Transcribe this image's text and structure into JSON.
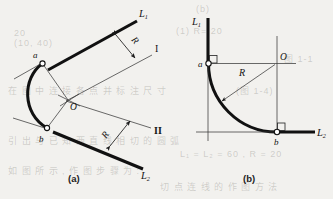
{
  "figure": {
    "background_color": "#f2f1ee",
    "ink_color": "#111111",
    "panels": [
      {
        "id": "a",
        "caption": "(a)",
        "description": "Two oblique lines L1 and L2 meeting at an obtuse V; auxiliary parallel lines I and II offset by radius R; center O located at their intersection; tangent points a and b.",
        "labels": {
          "line1": "L",
          "line1_sub": "1",
          "line2": "L",
          "line2_sub": "2",
          "radius_upper": "R",
          "radius_lower": "R",
          "aux_line_upper": "I",
          "aux_line_lower": "II",
          "center": "O",
          "tangent_point_upper": "a",
          "tangent_point_lower": "b"
        }
      },
      {
        "id": "b",
        "caption": "(b)",
        "description": "Vertical line L1 and horizontal line L2 meeting at a right angle; quarter-circle fillet of radius R; center O at intersection of offset construction lines; tangent points a and b with right-angle marks.",
        "labels": {
          "line1": "L",
          "line1_sub": "1",
          "line2": "L",
          "line2_sub": "2",
          "radius": "R",
          "center": "O",
          "tangent_point_upper": "a",
          "tangent_point_lower": "b"
        }
      }
    ]
  },
  "background_bleed": [
    {
      "text": "20",
      "x": 14,
      "y": 34
    },
    {
      "text": "(b)",
      "x": 196,
      "y": 10
    },
    {
      "text": "(1) R= 20",
      "x": 176,
      "y": 32
    },
    {
      "text": "(10, 40)",
      "x": 14,
      "y": 44
    },
    {
      "text": "图 1-1",
      "x": 284,
      "y": 58
    },
    {
      "text": "在 图 中 连 接 各 点 并 标 注 尺 寸",
      "x": 10,
      "y": 90
    },
    {
      "text": "(图 1-4)",
      "x": 236,
      "y": 90
    },
    {
      "text": "引 出 与 已 知 两 直 线 相 切 的 圆 弧",
      "x": 10,
      "y": 140
    },
    {
      "text": "L₁ = L₂ = 60 , R = 20",
      "x": 180,
      "y": 155
    },
    {
      "text": "如 图 所 示 , 作 图 步 骤 为 :",
      "x": 10,
      "y": 170
    },
    {
      "text": "切 点 连 线 的 作 图 方 法",
      "x": 160,
      "y": 186
    }
  ]
}
